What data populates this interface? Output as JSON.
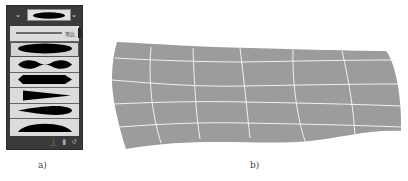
{
  "panel_a": {
    "caption": "a)",
    "top_bar": {
      "left_dropdown_icon": "chevron-down-icon",
      "right_dropdown_icon": "chevron-down-icon",
      "preview_profile": "ellipse"
    },
    "profiles": [
      {
        "shape": "uniform",
        "label": "等比"
      },
      {
        "shape": "ellipse",
        "selected": true
      },
      {
        "shape": "bulge-pinch"
      },
      {
        "shape": "hexagon-taper"
      },
      {
        "shape": "triangle-taper"
      },
      {
        "shape": "leaf"
      },
      {
        "shape": "half-dome"
      }
    ],
    "bottom_icons": [
      "flip-icon",
      "delete-icon",
      "reset-icon"
    ],
    "colors": {
      "panel_bg": "#3a3a3a",
      "list_bg": "#dcdcdc",
      "shape_fill": "#000000"
    }
  },
  "panel_b": {
    "caption": "b)",
    "description": "Warped grid mesh (envelope distortion)",
    "grid": {
      "rows": 5,
      "cols": 6
    },
    "colors": {
      "fill": "#9c9c9c",
      "grid_lines": "#f0f0f0"
    }
  }
}
